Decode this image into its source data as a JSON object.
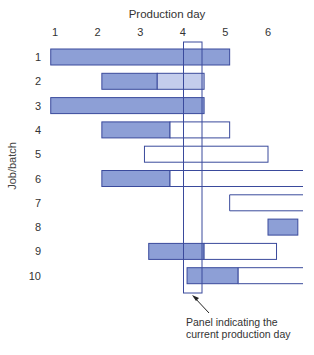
{
  "chart_data": {
    "type": "gantt",
    "title": "Production day",
    "xlabel": "Production day",
    "ylabel": "Job/batch",
    "x_ticks": [
      "1",
      "2",
      "3",
      "4",
      "5",
      "6"
    ],
    "y_ticks": [
      "1",
      "2",
      "3",
      "4",
      "5",
      "6",
      "7",
      "8",
      "9",
      "10"
    ],
    "current_day_marker": 4.2,
    "annotation": "Panel indicating the current production day",
    "legend": {
      "filled": "completed work",
      "light": "partially shaded (scheduled in progress)",
      "empty": "scheduled work remaining"
    },
    "jobs": [
      {
        "job": "1",
        "segments": [
          {
            "start": 0.9,
            "end": 5.1,
            "style": "filled"
          }
        ]
      },
      {
        "job": "2",
        "segments": [
          {
            "start": 2.1,
            "end": 3.4,
            "style": "filled"
          },
          {
            "start": 3.4,
            "end": 4.5,
            "style": "light"
          }
        ]
      },
      {
        "job": "3",
        "segments": [
          {
            "start": 0.9,
            "end": 4.5,
            "style": "filled"
          }
        ]
      },
      {
        "job": "4",
        "segments": [
          {
            "start": 2.1,
            "end": 3.7,
            "style": "filled"
          },
          {
            "start": 3.7,
            "end": 5.1,
            "style": "empty"
          }
        ]
      },
      {
        "job": "5",
        "segments": [
          {
            "start": 3.1,
            "end": 6.0,
            "style": "empty"
          }
        ]
      },
      {
        "job": "6",
        "segments": [
          {
            "start": 2.1,
            "end": 3.7,
            "style": "filled"
          },
          {
            "start": 3.7,
            "end": 6.8,
            "style": "empty",
            "open_end": true
          }
        ]
      },
      {
        "job": "7",
        "segments": [
          {
            "start": 5.1,
            "end": 6.8,
            "style": "empty",
            "open_end": true
          }
        ]
      },
      {
        "job": "8",
        "segments": [
          {
            "start": 6.0,
            "end": 6.7,
            "style": "filled"
          }
        ]
      },
      {
        "job": "9",
        "segments": [
          {
            "start": 3.2,
            "end": 4.5,
            "style": "filled"
          },
          {
            "start": 4.5,
            "end": 6.2,
            "style": "empty"
          }
        ]
      },
      {
        "job": "10",
        "segments": [
          {
            "start": 4.1,
            "end": 5.3,
            "style": "filled"
          },
          {
            "start": 5.3,
            "end": 6.8,
            "style": "empty",
            "open_end": true
          }
        ]
      }
    ],
    "colors": {
      "filled": "#8d9fd6",
      "light": "#c4cdec",
      "stroke": "#3a4a9c"
    }
  },
  "labels": {
    "title": "Production day",
    "ylabel": "Job/batch",
    "note_line1": "Panel indicating the",
    "note_line2": "current production day"
  }
}
